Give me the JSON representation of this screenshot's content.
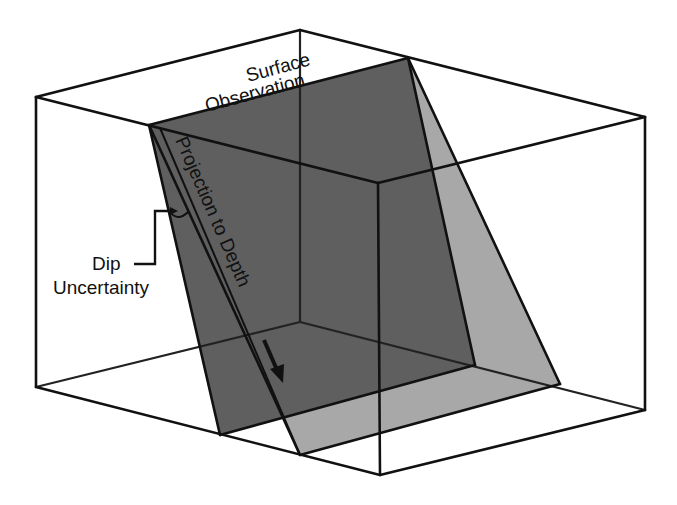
{
  "diagram": {
    "labels": {
      "surface_line1": "Surface",
      "surface_line2": "Observation",
      "projection": "Projection to Depth",
      "dip_line1": "Dip",
      "dip_line2": "Uncertainty"
    },
    "colors": {
      "background": "#ffffff",
      "box_edges": "#111111",
      "primary_plane": "#5f5f5f",
      "uncertainty_plane": "#a8a8a8",
      "text": "#111111"
    },
    "elements": {
      "block": "3D wireframe box",
      "primary_plane": "dark grey dipping fault plane",
      "uncertainty_plane": "light grey alternate dip plane",
      "arrow": "down-dip arrow"
    }
  }
}
